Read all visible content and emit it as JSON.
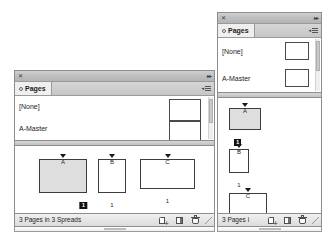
{
  "app": {
    "panel_title": "Pages",
    "tab_icon": "pages-tab-icon",
    "close_icon": "close-icon",
    "collapse_icon": "double-chevron-collapse-icon",
    "menu_icon": "panel-menu-icon"
  },
  "left_panel": {
    "name": "pages-panel-wide",
    "tab_label": "Pages",
    "masters": [
      {
        "name": "[None]",
        "thumb": "none-master-thumbnail"
      },
      {
        "name": "A-Master",
        "thumb": "a-master-thumbnail"
      }
    ],
    "pages": [
      {
        "master_letter": "A",
        "number": "1",
        "selected": true,
        "shape": "portrait-wide"
      },
      {
        "master_letter": "B",
        "number": "1",
        "selected": false,
        "shape": "portrait-narrow"
      },
      {
        "master_letter": "C",
        "number": "1",
        "selected": false,
        "shape": "landscape"
      }
    ],
    "status_text": "3 Pages in 3 Spreads",
    "status_buttons": [
      {
        "name": "create-new-page-button",
        "icon": "new-page-icon"
      },
      {
        "name": "create-new-spread-button",
        "icon": "new-spread-icon"
      },
      {
        "name": "delete-selected-pages-button",
        "icon": "trash-icon"
      }
    ]
  },
  "right_panel": {
    "name": "pages-panel-narrow",
    "tab_label": "Pages",
    "masters": [
      {
        "name": "[None]",
        "thumb": "none-master-thumbnail"
      },
      {
        "name": "A-Master",
        "thumb": "a-master-thumbnail"
      }
    ],
    "pages": [
      {
        "master_letter": "A",
        "number": "1",
        "selected": true,
        "shape": "portrait-wide"
      },
      {
        "master_letter": "B",
        "number": "1",
        "selected": false,
        "shape": "portrait-narrow"
      },
      {
        "master_letter": "C",
        "number": "1",
        "selected": false,
        "shape": "landscape"
      }
    ],
    "status_text": "3 Pages i",
    "status_buttons": [
      {
        "name": "create-new-page-button",
        "icon": "new-page-icon"
      },
      {
        "name": "create-new-spread-button",
        "icon": "new-spread-icon"
      },
      {
        "name": "delete-selected-pages-button",
        "icon": "trash-icon"
      }
    ]
  },
  "colors": {
    "panel_bg": "#f4f4f4",
    "titlebar": "#bdbdbd",
    "tab_active": "#efefef",
    "border": "#8d8d8d",
    "selected_page_fill": "#dedede",
    "badge_bg": "#111111",
    "canvas": "#ffffff"
  }
}
